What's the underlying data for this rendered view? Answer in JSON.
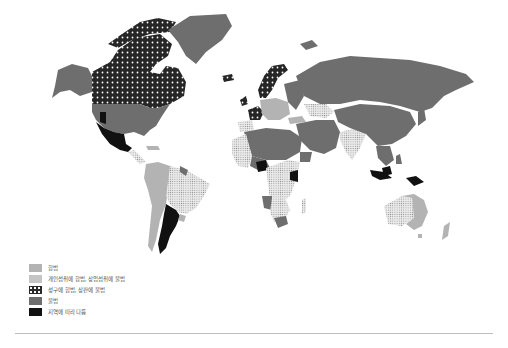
{
  "map": {
    "type": "choropleth-world",
    "categories": [
      {
        "id": "legal",
        "label": "합법",
        "fill": "#b3b3b3",
        "pattern": "solid-light"
      },
      {
        "id": "personal",
        "label": "개인섭취에 합법, 상업섭취에 불법",
        "fill": "#e8e8e8",
        "pattern": "fine-dots"
      },
      {
        "id": "medical",
        "label": "성구에 합법, 상판에 불법",
        "fill": "#2a2a2a",
        "pattern": "white-dots-on-black"
      },
      {
        "id": "illegal",
        "label": "불법",
        "fill": "#6e6e6e",
        "pattern": "solid-dark"
      },
      {
        "id": "varies",
        "label": "지역에 따라 다름",
        "fill": "#111111",
        "pattern": "solid-black"
      }
    ],
    "regions": {
      "canada": "medical",
      "alaska_usa": "illegal",
      "greenland": "illegal",
      "usa_west_states": "varies",
      "mexico": "varies",
      "central_america": "personal",
      "colombia_peru_bolivia": "legal",
      "brazil": "personal",
      "argentina": "varies",
      "chile": "legal",
      "uruguay": "legal",
      "scandinavia": "medical",
      "france_spain": "medical",
      "western_europe": "legal",
      "russia": "illegal",
      "middle_east": "illegal",
      "north_africa": "illegal",
      "west_africa": "personal",
      "nigeria": "varies",
      "kenya": "varies",
      "central_africa": "personal",
      "southern_africa": "personal",
      "india": "personal",
      "china": "illegal",
      "indonesia": "varies",
      "australia_west": "personal",
      "australia_east": "legal",
      "new_zealand": "legal"
    }
  },
  "legend": {
    "items": [
      {
        "label": "합법",
        "swatch": "legal"
      },
      {
        "label": "개인섭취에 합법, 상업섭취에 불법",
        "swatch": "personal"
      },
      {
        "label": "성구에 합법, 상판에 불법",
        "swatch": "medical"
      },
      {
        "label": "불법",
        "swatch": "illegal"
      },
      {
        "label": "지역에 따라 다름",
        "swatch": "varies"
      }
    ]
  }
}
